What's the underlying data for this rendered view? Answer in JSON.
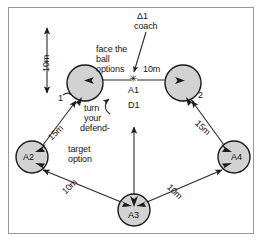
{
  "diagram": {
    "type": "field-drill-diagram",
    "border_color": "#9a9a9a",
    "circle_fill": "#d2d2d2",
    "circle_stroke": "#1a1a1a",
    "line_color": "#2a2a2a",
    "text_color": "#141414"
  },
  "players": [
    {
      "key": "p1",
      "label": "1",
      "label_pos": "outside-bottom-left",
      "cx": 85,
      "cy": 83,
      "r": 18
    },
    {
      "key": "p2",
      "label": "2",
      "label_pos": "outside-right",
      "cx": 183,
      "cy": 83,
      "r": 18
    },
    {
      "key": "a2",
      "label": "A2",
      "label_pos": "inside",
      "cx": 32,
      "cy": 157,
      "r": 16
    },
    {
      "key": "a4",
      "label": "A4",
      "label_pos": "inside",
      "cx": 234,
      "cy": 157,
      "r": 16
    },
    {
      "key": "a3",
      "label": "A3",
      "label_pos": "inside",
      "cx": 134,
      "cy": 210,
      "r": 16
    }
  ],
  "center_marker": {
    "name": "ball-marker",
    "glyph": "✳",
    "x": 134,
    "y": 80,
    "label_below": "A1",
    "label_below2": "D1"
  },
  "annotations": {
    "coach": "Δ1\ncoach",
    "coach_line1": "Δ1",
    "coach_line2": "coach",
    "face_the_ball": "face the\nball\noptions",
    "face_line1": "face the",
    "face_line2": "ball",
    "face_line3": "options",
    "turn_your_defender": "turn\nyour\ndefend-",
    "turn_line1": "turn",
    "turn_line2": "your",
    "turn_line3": "defend-",
    "target_option": "target\noption",
    "target_line1": "target",
    "target_line2": "option",
    "a1": "A1",
    "d1": "D1",
    "player1": "1",
    "player2": "2",
    "a2": "A2",
    "a3": "A3",
    "a4": "A4"
  },
  "distances": {
    "vertical_left": "10m",
    "center_right": "10m",
    "left_diagonal_upper": "15m",
    "right_diagonal_upper": "15m",
    "left_diagonal_lower": "10m",
    "right_diagonal_lower": "10m"
  }
}
